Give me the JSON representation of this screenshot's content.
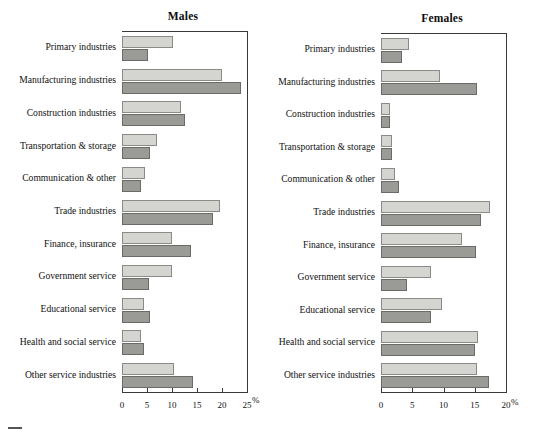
{
  "figure": {
    "categories": [
      "Primary industries",
      "Manufacturing industries",
      "Construction industries",
      "Transportation & storage",
      "Communication & other",
      "Trade industries",
      "Finance, insurance",
      "Government service",
      "Educational service",
      "Health and social service",
      "Other service industries"
    ],
    "unit_label": "%",
    "colors": {
      "series_light": "#d4d4d0",
      "series_dark": "#9a9a96",
      "axis": "#3a3a3a",
      "text": "#111111"
    }
  },
  "chart_data": [
    {
      "type": "bar",
      "title": "Males",
      "orientation": "horizontal",
      "xlabel": "%",
      "ylabel": "",
      "xlim": [
        0,
        25
      ],
      "xticks": [
        0,
        5,
        10,
        15,
        20,
        25
      ],
      "xticklabels": [
        "0",
        "5",
        "10",
        "15",
        "20",
        "25"
      ],
      "grid": false,
      "legend": "none",
      "categories": [
        "Primary industries",
        "Manufacturing industries",
        "Construction industries",
        "Transportation & storage",
        "Communication & other",
        "Trade industries",
        "Finance, insurance",
        "Government service",
        "Educational service",
        "Health and social service",
        "Other service industries"
      ],
      "series": [
        {
          "name": "light",
          "values": [
            10.2,
            20.0,
            11.7,
            7.0,
            4.6,
            19.6,
            10.0,
            10.0,
            4.4,
            3.8,
            10.4
          ]
        },
        {
          "name": "dark",
          "values": [
            5.2,
            23.7,
            12.5,
            5.6,
            3.7,
            18.1,
            13.7,
            5.4,
            5.6,
            4.4,
            14.2
          ]
        }
      ]
    },
    {
      "type": "bar",
      "title": "Females",
      "orientation": "horizontal",
      "xlabel": "%",
      "ylabel": "",
      "xlim": [
        0,
        20
      ],
      "xticks": [
        0,
        5,
        10,
        15,
        20
      ],
      "xticklabels": [
        "0",
        "5",
        "10",
        "15",
        "20"
      ],
      "grid": false,
      "legend": "none",
      "categories": [
        "Primary industries",
        "Manufacturing industries",
        "Construction industries",
        "Transportation & storage",
        "Communication & other",
        "Trade industries",
        "Finance, insurance",
        "Government service",
        "Educational service",
        "Health and social service",
        "Other service industries"
      ],
      "series": [
        {
          "name": "light",
          "values": [
            4.5,
            9.5,
            1.5,
            1.8,
            2.3,
            17.5,
            13.0,
            8.0,
            9.8,
            15.5,
            15.3
          ]
        },
        {
          "name": "dark",
          "values": [
            3.3,
            15.3,
            1.5,
            1.7,
            2.8,
            16.0,
            15.2,
            4.2,
            8.0,
            15.0,
            17.2
          ]
        }
      ]
    }
  ]
}
